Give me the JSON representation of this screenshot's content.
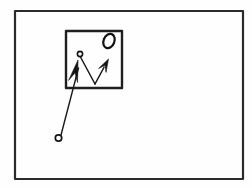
{
  "figure": {
    "title": "Line drawing figure",
    "background_color": "#fefefe",
    "ink_color": "#1a1a1a",
    "canvas": {
      "width": 252,
      "height": 188
    },
    "outer_frame": {
      "name": "outer rectangle frame",
      "x": 15,
      "y": 11,
      "width": 228,
      "height": 168,
      "stroke_width": 2.2,
      "color": "#2b2b2b"
    },
    "inner_box": {
      "name": "inner square box",
      "x": 66,
      "y": 31,
      "width": 56,
      "height": 57,
      "stroke_width": 2.4,
      "color": "#1f1f1f"
    },
    "oval_glyph": {
      "name": "slanted oval O glyph",
      "cx": 109,
      "cy": 41,
      "rx": 5.4,
      "ry": 7.4,
      "rotation_deg": 22,
      "stroke_width": 2.2,
      "color": "#141414"
    },
    "inner_node": {
      "name": "small open circle inside box",
      "cx": 80,
      "cy": 54,
      "r": 2.6,
      "stroke_width": 1.6,
      "color": "#141414"
    },
    "outer_node": {
      "name": "small open circle lower left",
      "cx": 58.5,
      "cy": 138,
      "r": 3.2,
      "stroke_width": 1.7,
      "color": "#141414"
    },
    "connector_line": {
      "name": "line from inner node down to V vertex",
      "x1": 80.5,
      "y1": 57,
      "x2": 95,
      "y2": 84,
      "stroke_width": 1.5,
      "color": "#1a1a1a"
    },
    "long_pointer_line": {
      "name": "long line from lower circle to left arrowhead",
      "x1": 61,
      "y1": 135,
      "x2": 78.5,
      "y2": 68,
      "stroke_width": 1.4,
      "color": "#1a1a1a"
    },
    "left_arrow": {
      "name": "left arrowhead pointing up",
      "tip_x": 78,
      "tip_y": 60,
      "angle_deg": -77,
      "length": 22,
      "half_width": 4.6,
      "color": "#141414"
    },
    "right_arrow": {
      "name": "right arrowhead pointing up-right",
      "tail_x": 95,
      "tail_y": 84,
      "tip_x": 108.5,
      "tip_y": 59,
      "stroke_width": 1.5,
      "head_length": 13,
      "head_half_width": 4.2,
      "color": "#141414"
    },
    "counts": {
      "rectangles": 2,
      "circles": 2,
      "arrows": 2,
      "ovals": 1
    }
  }
}
